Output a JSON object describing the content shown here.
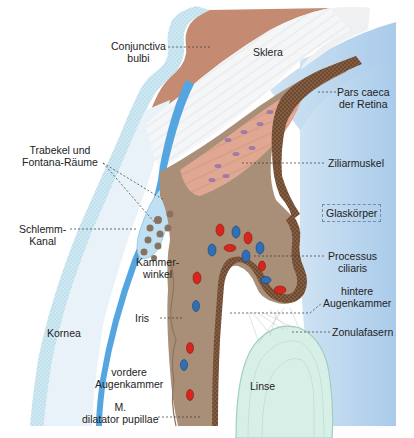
{
  "figure": {
    "colors": {
      "conjunctiva_epithelium": "#cfe9f3",
      "conjunctiva_stroma": "#c58a72",
      "sclera": "#f4f5f6",
      "cornea": "#e6f1f7",
      "descemet_blue": "#55a6e0",
      "ciliary_muscle": "#dfa58f",
      "uvea_brown": "#a98f78",
      "pigment_epithelium": "#6e4a32",
      "vitreous": "#bcd7ee",
      "lens": "#d8efe8",
      "artery_red": "#d9261c",
      "vein_blue": "#2f6fb8"
    }
  },
  "labels": {
    "conjunctiva": {
      "line1": "Conjunctiva",
      "line2": "bulbi"
    },
    "sklera": "Sklera",
    "pars_caeca": {
      "line1": "Pars caeca",
      "line2": "der Retina"
    },
    "trabekel": {
      "line1": "Trabekel und",
      "line2": "Fontana-Räume"
    },
    "ziliarmuskel": "Ziliarmuskel",
    "glaskoerper": "Glaskörper",
    "schlemm": {
      "line1": "Schlemm-",
      "line2": "Kanal"
    },
    "kammerwinkel": {
      "line1": "Kammer-",
      "line2": "winkel"
    },
    "processus": {
      "line1": "Processus",
      "line2": "ciliaris"
    },
    "hintere": {
      "line1": "hintere",
      "line2": "Augenkammer"
    },
    "iris": "Iris",
    "zonula": "Zonulafasern",
    "kornea": "Kornea",
    "vordere": {
      "line1": "vordere",
      "line2": "Augenkammer"
    },
    "linse": "Linse",
    "dilatator": {
      "line1": "M.",
      "line2": "dilatator pupillae"
    }
  }
}
